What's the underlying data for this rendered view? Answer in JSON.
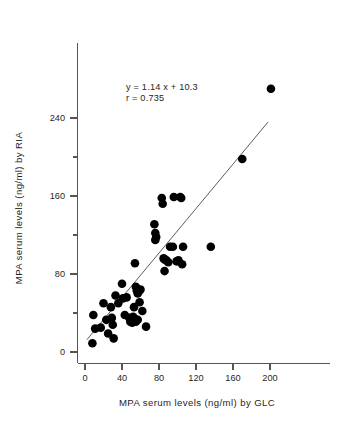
{
  "chart_data": {
    "type": "scatter",
    "title": "",
    "xlabel": "MPA serum levels (ng/ml) by GLC",
    "ylabel": "MPA serum levels (ng/ml) by RIA",
    "xlim": [
      0,
      220
    ],
    "ylim": [
      0,
      290
    ],
    "xticks": [
      0,
      40,
      80,
      120,
      160,
      200
    ],
    "xtick_labels": [
      "0",
      "40",
      "80",
      "120",
      "160",
      "200"
    ],
    "xminor_ticks": [
      20,
      60,
      100,
      140,
      180
    ],
    "yticks": [
      0,
      80,
      160,
      240
    ],
    "ytick_labels": [
      "0",
      "80",
      "160",
      "240"
    ],
    "yminor_ticks": [
      40,
      120,
      200
    ],
    "grid": false,
    "legend": "none",
    "marker": "filled-circle",
    "marker_color": "#000000",
    "annotations": [
      "y = 1.14 x + 10.3",
      "r = 0.735"
    ],
    "fit": {
      "slope": 1.14,
      "intercept": 10.3,
      "r": 0.735,
      "x_start": 2,
      "x_end": 198,
      "color": "#4a4a4a",
      "equation_label": "y = 1.14 x + 10.3",
      "correlation_label": "r = 0.735"
    },
    "series": [
      {
        "name": "MPA serum samples",
        "points": [
          [
            8,
            9
          ],
          [
            9,
            38
          ],
          [
            11,
            24
          ],
          [
            17,
            25
          ],
          [
            20,
            50
          ],
          [
            23,
            33
          ],
          [
            25,
            19
          ],
          [
            28,
            46
          ],
          [
            29,
            35
          ],
          [
            30,
            28
          ],
          [
            31,
            14
          ],
          [
            33,
            58
          ],
          [
            36,
            50
          ],
          [
            40,
            70
          ],
          [
            41,
            55
          ],
          [
            43,
            38
          ],
          [
            45,
            56
          ],
          [
            48,
            35
          ],
          [
            49,
            31
          ],
          [
            50,
            33
          ],
          [
            51,
            30
          ],
          [
            52,
            36
          ],
          [
            53,
            46
          ],
          [
            54,
            91
          ],
          [
            54,
            34
          ],
          [
            55,
            67
          ],
          [
            55,
            31
          ],
          [
            56,
            63
          ],
          [
            57,
            60
          ],
          [
            57,
            33
          ],
          [
            58,
            62
          ],
          [
            59,
            51
          ],
          [
            60,
            64
          ],
          [
            62,
            42
          ],
          [
            66,
            26
          ],
          [
            75,
            131
          ],
          [
            76,
            122
          ],
          [
            76,
            115
          ],
          [
            77,
            118
          ],
          [
            83,
            158
          ],
          [
            84,
            152
          ],
          [
            85,
            96
          ],
          [
            86,
            95
          ],
          [
            86,
            83
          ],
          [
            88,
            94
          ],
          [
            90,
            92
          ],
          [
            92,
            108
          ],
          [
            95,
            108
          ],
          [
            96,
            159
          ],
          [
            99,
            93
          ],
          [
            101,
            94
          ],
          [
            103,
            159
          ],
          [
            104,
            158
          ],
          [
            105,
            90
          ],
          [
            106,
            108
          ],
          [
            136,
            108
          ],
          [
            170,
            198
          ],
          [
            201,
            270
          ]
        ]
      }
    ]
  },
  "geometry": {
    "plot_left_px": 85,
    "plot_bottom_px": 352,
    "x_scale_px_per_unit": 0.925,
    "y_scale_px_per_unit": 0.975,
    "marker_radius_px": 4.3
  }
}
